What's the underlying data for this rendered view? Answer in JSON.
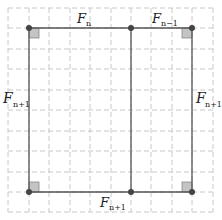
{
  "diagram": {
    "colors": {
      "grid": "#c8c8c8",
      "line": "#555555",
      "point": "#444444",
      "right_angle_fill": "#c4c4c4"
    },
    "labels": {
      "top_left": {
        "base": "F",
        "sub": "n"
      },
      "top_right": {
        "base": "F",
        "sub": "n−1"
      },
      "left": {
        "base": "F",
        "sub": "n+1"
      },
      "right": {
        "base": "F",
        "sub": "n+1"
      },
      "bottom": {
        "base": "F",
        "sub": "n+1"
      }
    },
    "points": [
      {
        "name": "top-left",
        "x": 29,
        "y": 28
      },
      {
        "name": "top-middle",
        "x": 131,
        "y": 28
      },
      {
        "name": "top-right",
        "x": 192,
        "y": 28
      },
      {
        "name": "bottom-left",
        "x": 29,
        "y": 192
      },
      {
        "name": "bottom-middle",
        "x": 131,
        "y": 192
      },
      {
        "name": "bottom-right",
        "x": 192,
        "y": 192
      }
    ]
  }
}
